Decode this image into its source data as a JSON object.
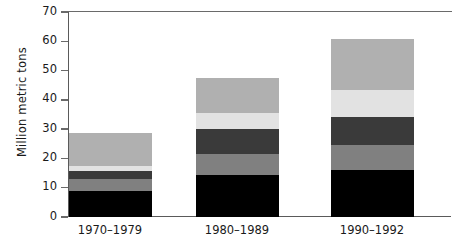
{
  "chart_data": {
    "type": "bar",
    "stacked": true,
    "title": "",
    "xlabel": "",
    "ylabel": "Million metric tons",
    "ylim": [
      0,
      70
    ],
    "yticks": [
      0,
      10,
      20,
      30,
      40,
      50,
      60,
      70
    ],
    "ytick_labels": [
      "0",
      "10",
      "20",
      "30",
      "40",
      "50",
      "60",
      "70"
    ],
    "grid": false,
    "legend": "none",
    "categories": [
      "1970–1979",
      "1980–1989",
      "1990–1992"
    ],
    "series": [
      {
        "name": "segment-1",
        "color": "#000000",
        "values": [
          9.0,
          14.3,
          16.1
        ]
      },
      {
        "name": "segment-2",
        "color": "#808080",
        "values": [
          4.0,
          7.2,
          8.6
        ]
      },
      {
        "name": "segment-3",
        "color": "#3a3a3a",
        "values": [
          2.7,
          8.5,
          9.3
        ]
      },
      {
        "name": "segment-4",
        "color": "#e2e2e2",
        "values": [
          1.8,
          5.5,
          9.5
        ]
      },
      {
        "name": "segment-5",
        "color": "#b0b0b0",
        "values": [
          11.2,
          12.0,
          17.2
        ]
      }
    ],
    "totals": [
      28.7,
      47.5,
      60.7
    ]
  },
  "axis": {
    "y_title": "Million metric tons",
    "tick_0": "0",
    "tick_10": "10",
    "tick_20": "20",
    "tick_30": "30",
    "tick_40": "40",
    "tick_50": "50",
    "tick_60": "60",
    "tick_70": "70"
  },
  "xaxis": {
    "label_1": "1970–1979",
    "label_2": "1980–1989",
    "label_3": "1990–1992"
  },
  "colors": {
    "axis": "#5a5a5a",
    "text": "#1a1a1a",
    "background": "#ffffff"
  }
}
